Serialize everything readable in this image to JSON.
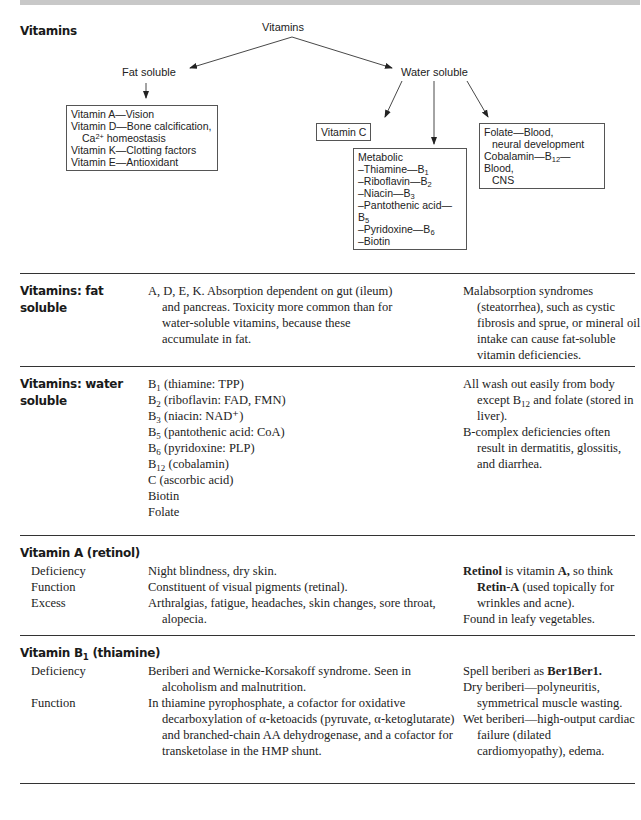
{
  "diagram": {
    "section_title": "Vitamins",
    "root": "Vitamins",
    "fat_soluble": {
      "label": "Fat soluble",
      "items": [
        "Vitamin A—Vision",
        "Vitamin D—Bone calcification,",
        "Ca",
        "2+",
        " homeostasis",
        "Vitamin K—Clotting factors",
        "Vitamin E—Antioxidant"
      ]
    },
    "water_soluble": {
      "label": "Water soluble",
      "vitamin_c": "Vitamin C",
      "metabolic": {
        "title": "Metabolic",
        "items": [
          {
            "name": "–Thiamine—B",
            "sub": "1"
          },
          {
            "name": "–Riboflavin—B",
            "sub": "2"
          },
          {
            "name": "–Niacin—B",
            "sub": "3"
          },
          {
            "name": "–Pantothenic acid—B",
            "sub": "5"
          },
          {
            "name": "–Pyridoxine—B",
            "sub": "6"
          },
          {
            "name": "–Biotin",
            "sub": ""
          }
        ]
      },
      "folate": {
        "line1": "Folate—Blood,",
        "line2": "neural development",
        "line3a": "Cobalamin—B",
        "line3sub": "12",
        "line3b": "—Blood,",
        "line4": "CNS"
      }
    }
  },
  "fat_soluble_section": {
    "title_line1": "Vitamins: fat",
    "title_line2": "soluble",
    "description": "A, D, E, K. Absorption dependent on gut (ileum) and pancreas. Toxicity more common than for water-soluble vitamins, because these accumulate in fat.",
    "note": "Malabsorption syndromes (steatorrhea), such as cystic fibrosis and sprue, or mineral oil intake can cause fat-soluble vitamin deficiencies."
  },
  "water_soluble_section": {
    "title_line1": "Vitamins: water",
    "title_line2": "soluble",
    "list": [
      {
        "pre": "B",
        "sub": "1",
        "post": " (thiamine: TPP)"
      },
      {
        "pre": "B",
        "sub": "2",
        "post": " (riboflavin: FAD, FMN)"
      },
      {
        "pre": "B",
        "sub": "3",
        "post": " (niacin: NAD⁺)"
      },
      {
        "pre": "B",
        "sub": "5",
        "post": " (pantothenic acid: CoA)"
      },
      {
        "pre": "B",
        "sub": "6",
        "post": " (pyridoxine: PLP)"
      },
      {
        "pre": "B",
        "sub": "12",
        "post": " (cobalamin)"
      },
      {
        "pre": "C (ascorbic acid)",
        "sub": "",
        "post": ""
      },
      {
        "pre": "Biotin",
        "sub": "",
        "post": ""
      },
      {
        "pre": "Folate",
        "sub": "",
        "post": ""
      }
    ],
    "note1_a": "All wash out easily from body except B",
    "note1_sub": "12",
    "note1_b": " and folate (stored in liver).",
    "note2": "B-complex deficiencies often result in dermatitis, glossitis, and diarrhea."
  },
  "vitamin_a": {
    "title": "Vitamin A (retinol)",
    "rows": [
      {
        "label": "Deficiency",
        "text": "Night blindness, dry skin."
      },
      {
        "label": "Function",
        "text": "Constituent of visual pigments (retinal)."
      },
      {
        "label": "Excess",
        "text": "Arthralgias, fatigue, headaches, skin changes, sore throat, alopecia."
      }
    ],
    "note": {
      "b1": "Retinol",
      "t1": " is vitamin ",
      "b2": "A,",
      "t2": " so think ",
      "b3": "Retin-A",
      "t3": " (used topically for wrinkles and acne).",
      "line2": "Found in leafy vegetables."
    }
  },
  "vitamin_b1": {
    "title_pre": "Vitamin B",
    "title_sub": "1",
    "title_post": " (thiamine)",
    "rows": [
      {
        "label": "Deficiency",
        "text": "Beriberi and Wernicke-Korsakoff syndrome. Seen in alcoholism and malnutrition."
      },
      {
        "label": "Function",
        "text": "In thiamine pyrophosphate, a cofactor for oxidative decarboxylation of α-ketoacids (pyruvate, α-ketoglutarate) and branched-chain AA dehydrogenase, and a cofactor for transketolase in the HMP shunt."
      }
    ],
    "note": {
      "t1": "Spell beriberi as ",
      "b1": "Ber1Ber1.",
      "dry": "Dry beriberi—polyneuritis, symmetrical muscle wasting.",
      "wet": "Wet beriberi—high-output cardiac failure (dilated cardiomyopathy), edema."
    }
  }
}
